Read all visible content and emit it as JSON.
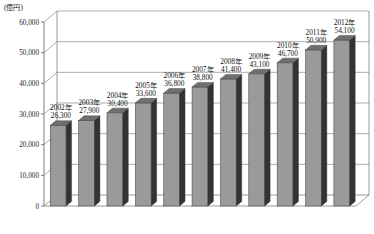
{
  "chart_data": {
    "type": "bar",
    "title": "",
    "subtitle": "",
    "xlabel": "",
    "ylabel": "",
    "unit_label": "(億円)",
    "categories": [
      "2002年",
      "2003年",
      "2004年",
      "2005年",
      "2006年",
      "2007年",
      "2008年",
      "2009年",
      "2010年",
      "2011年",
      "2012年"
    ],
    "values": [
      26300,
      27900,
      30400,
      33600,
      36800,
      38800,
      41400,
      43100,
      46700,
      50900,
      54100
    ],
    "value_labels": [
      "26,300",
      "27,900",
      "30,400",
      "33,600",
      "36,800",
      "38,800",
      "41,400",
      "43,100",
      "46,700",
      "50,900",
      "54,100"
    ],
    "ylim": [
      0,
      60000
    ],
    "yticks": [
      0,
      10000,
      20000,
      30000,
      40000,
      50000,
      60000
    ],
    "ytick_labels": [
      "0",
      "10,000",
      "20,000",
      "30,000",
      "40,000",
      "50,000",
      "60,000"
    ],
    "grid": true,
    "legend": false,
    "legend_position": "none",
    "style": "3d-column",
    "colors": {
      "bar_face": "#9a9a9a",
      "bar_side": "#333333",
      "bar_top": "#6f6f6f",
      "bar_edge": "#3a3a3a",
      "grid": "#8a8a8a",
      "axis": "#6f6f6f",
      "text": "#111111",
      "background": "#ffffff"
    }
  },
  "axis": {
    "unit": "(億円)"
  }
}
